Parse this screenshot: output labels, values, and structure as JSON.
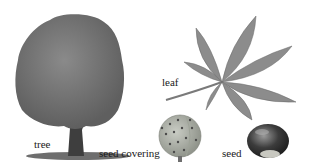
{
  "diagram": {
    "labels": {
      "tree": "tree",
      "leaf": "leaf",
      "seed_covering": "seed covering",
      "seed": "seed"
    },
    "icons": [
      "tree-illustration",
      "leaf-illustration",
      "seed-covering-illustration",
      "seed-illustration"
    ]
  }
}
